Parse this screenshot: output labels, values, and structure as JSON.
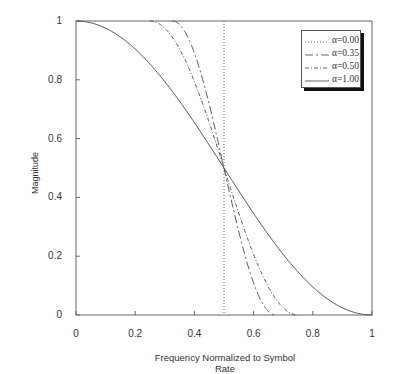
{
  "chart_data": {
    "type": "line",
    "title": "",
    "xlabel": "Frequency Normalized to Symbol Rate",
    "ylabel": "Magnitude",
    "xlim": [
      0,
      1
    ],
    "ylim": [
      0,
      1
    ],
    "xticks": [
      "0",
      "0.2",
      "0.4",
      "0.6",
      "0.8",
      "1"
    ],
    "yticks": [
      "0",
      "0.2",
      "0.4",
      "0.6",
      "0.8",
      "1"
    ],
    "grid": false,
    "legend_position": "upper right",
    "formula": "raised-cosine: 1 for f<(1-a)/2; 0.5*(1+cos(pi/a*(f-(1-a)/2))) between; 0 for f>(1+a)/2",
    "series": [
      {
        "name": "α=0.00",
        "alpha": 0.0,
        "style": "dotted",
        "x": [
          0,
          0.5,
          0.5,
          0.5,
          1
        ],
        "y": [
          1,
          1,
          0.5,
          0,
          0
        ]
      },
      {
        "name": "α=0.35",
        "alpha": 0.35,
        "style": "long-dash",
        "x": [
          0,
          0.325,
          0.4,
          0.45,
          0.5,
          0.55,
          0.6,
          0.675,
          1
        ],
        "y": [
          1,
          1,
          0.82,
          0.67,
          0.5,
          0.33,
          0.18,
          0,
          0
        ]
      },
      {
        "name": "α=0.50",
        "alpha": 0.5,
        "style": "dash-dot",
        "x": [
          0,
          0.25,
          0.35,
          0.45,
          0.5,
          0.55,
          0.65,
          0.75,
          1
        ],
        "y": [
          1,
          1,
          0.9,
          0.65,
          0.5,
          0.35,
          0.1,
          0,
          0
        ]
      },
      {
        "name": "α=1.00",
        "alpha": 1.0,
        "style": "solid",
        "x": [
          0,
          0.1,
          0.2,
          0.3,
          0.4,
          0.5,
          0.6,
          0.7,
          0.8,
          0.9,
          1
        ],
        "y": [
          1,
          0.98,
          0.9,
          0.79,
          0.65,
          0.5,
          0.35,
          0.21,
          0.1,
          0.02,
          0
        ]
      }
    ]
  },
  "axes": {
    "xlabel": "Frequency Normalized to Symbol Rate",
    "ylabel": "Magnitude",
    "xticks": [
      "0",
      "0.2",
      "0.4",
      "0.6",
      "0.8",
      "1"
    ],
    "yticks": [
      "0",
      "0.2",
      "0.4",
      "0.6",
      "0.8",
      "1"
    ]
  },
  "legend": {
    "items": [
      {
        "label": "α=0.00",
        "dash": "1,2"
      },
      {
        "label": "α=0.35",
        "dash": "8,3,2,3"
      },
      {
        "label": "α=0.50",
        "dash": "4,2,1,2"
      },
      {
        "label": "α=1.00",
        "dash": ""
      }
    ]
  },
  "colors": {
    "line": "#555555",
    "axis": "#555555"
  }
}
